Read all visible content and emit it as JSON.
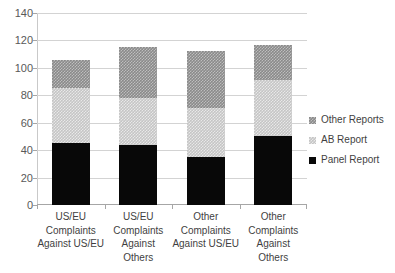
{
  "chart_data": {
    "type": "bar",
    "subtype": "stacked-column",
    "title": "",
    "subtitle": "",
    "xlabel": "",
    "ylabel": "",
    "ylim": [
      0,
      140
    ],
    "ytick_step": 20,
    "yticks": [
      "140",
      "120",
      "100",
      "80",
      "60",
      "40",
      "20",
      "0"
    ],
    "grid": true,
    "legend_position": "right",
    "categories": [
      "US/EU Complaints Against US/EU",
      "US/EU Complaints Against Others",
      "Other Complaints Against US/EU",
      "Other Complaints Against Others"
    ],
    "category_lines": [
      [
        "US/EU",
        "Complaints",
        "Against US/EU"
      ],
      [
        "US/EU",
        "Complaints",
        "Against",
        "Others"
      ],
      [
        "Other",
        "Complaints",
        "Against US/EU"
      ],
      [
        "Other",
        "Complaints",
        "Against",
        "Others"
      ]
    ],
    "series": [
      {
        "name": "Panel Report",
        "color": "#080808",
        "values": [
          45,
          44,
          35,
          50
        ]
      },
      {
        "name": "AB Report",
        "color": "#c5c5c5",
        "values": [
          40,
          34,
          36,
          41
        ]
      },
      {
        "name": "Other Reports",
        "color": "#8a8a8a",
        "values": [
          21,
          37,
          41,
          26
        ]
      }
    ],
    "totals": [
      106,
      115,
      112,
      117
    ]
  },
  "legend": {
    "items": [
      {
        "label": "Other Reports",
        "color": "#8a8a8a"
      },
      {
        "label": "AB Report",
        "color": "#c5c5c5"
      },
      {
        "label": "Panel Report",
        "color": "#080808"
      }
    ]
  }
}
